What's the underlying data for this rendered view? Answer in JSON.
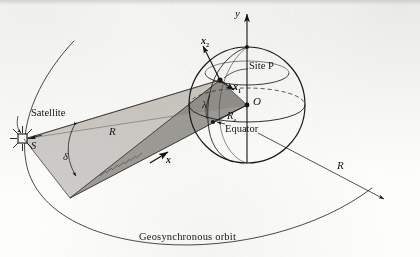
{
  "figure": {
    "caption_bottom": "Geosynchronous orbit",
    "domain": "diagram",
    "colors": {
      "ink": "#161513",
      "paper": "#fdfdfb",
      "light_triangle": "#c9c6bf",
      "dark_triangle": "#8f8d88",
      "mid_triangle": "#a8a5a0",
      "sphere_outline": "#1a1a18"
    }
  },
  "labels": {
    "y_axis": "y",
    "x2_vector": "x",
    "x2_subscript": "2",
    "x1_vector": "x",
    "x1_subscript": "1",
    "x_vector": "x",
    "site_p": "Site P",
    "origin": "O",
    "earth_radius": "R",
    "earth_radius_subscript": "e",
    "equator": "Equator",
    "satellite": "Satellite",
    "satellite_point": "S",
    "range_vector": "R",
    "orbit_radius": "R",
    "declination": "δ",
    "latitude": "λ",
    "orbit_caption": "Geosynchronous orbit"
  },
  "geometry": {
    "sphere_center": [
      247,
      105
    ],
    "sphere_radius": 58,
    "site_p_point": [
      220,
      80
    ],
    "satellite_point": [
      22,
      139
    ],
    "cone_apex": [
      70,
      198
    ],
    "equator_point": [
      213,
      122
    ]
  }
}
